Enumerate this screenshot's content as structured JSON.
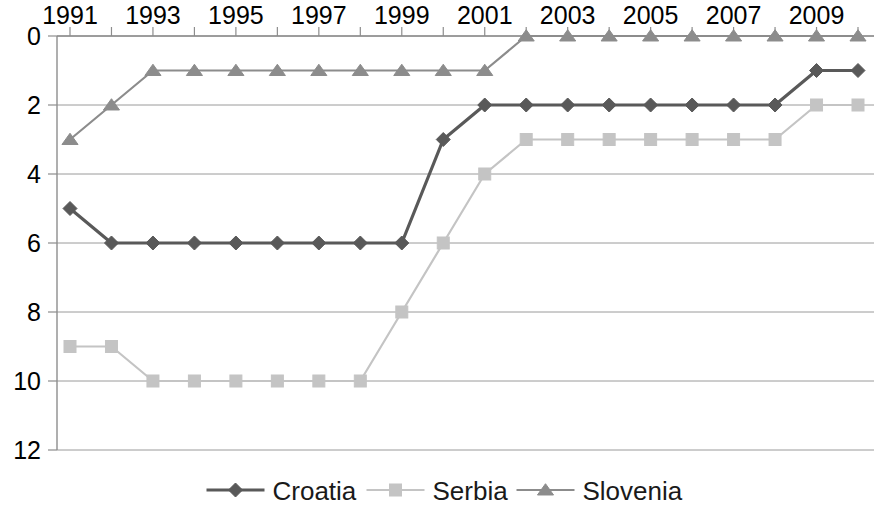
{
  "chart_data": {
    "type": "line",
    "title": "",
    "subtitle": "",
    "xlabel": "",
    "ylabel": "",
    "x": [
      1991,
      1992,
      1993,
      1994,
      1995,
      1996,
      1997,
      1998,
      1999,
      2000,
      2001,
      2002,
      2003,
      2004,
      2005,
      2006,
      2007,
      2008,
      2009,
      2010
    ],
    "x_tick_labels": [
      "1991",
      "1993",
      "1995",
      "1997",
      "1999",
      "2001",
      "2003",
      "2005",
      "2007",
      "2009"
    ],
    "x_tick_values": [
      1991,
      1993,
      1995,
      1997,
      1999,
      2001,
      2003,
      2005,
      2007,
      2009
    ],
    "y_tick_labels": [
      "0",
      "2",
      "4",
      "6",
      "8",
      "10",
      "12"
    ],
    "y_tick_values": [
      0,
      2,
      4,
      6,
      8,
      10,
      12
    ],
    "ylim": [
      0,
      12
    ],
    "y_axis_inverted": true,
    "xlim": [
      1991,
      2010
    ],
    "grid": "horizontal",
    "legend_position": "bottom",
    "series": [
      {
        "name": "Croatia",
        "color": "#595959",
        "marker": "diamond",
        "values": [
          5,
          6,
          6,
          6,
          6,
          6,
          6,
          6,
          6,
          3,
          2,
          2,
          2,
          2,
          2,
          2,
          2,
          2,
          1,
          1
        ]
      },
      {
        "name": "Serbia",
        "color": "#c4c4c4",
        "marker": "square",
        "values": [
          9,
          9,
          10,
          10,
          10,
          10,
          10,
          10,
          8,
          6,
          4,
          3,
          3,
          3,
          3,
          3,
          3,
          3,
          2,
          2
        ]
      },
      {
        "name": "Slovenia",
        "color": "#8c8c8c",
        "marker": "triangle",
        "values": [
          3,
          2,
          1,
          1,
          1,
          1,
          1,
          1,
          1,
          1,
          1,
          0,
          0,
          0,
          0,
          0,
          0,
          0,
          0,
          0
        ]
      }
    ]
  },
  "legend": {
    "items": [
      {
        "label": "Croatia",
        "color": "#595959",
        "marker": "diamond"
      },
      {
        "label": "Serbia",
        "color": "#c4c4c4",
        "marker": "square"
      },
      {
        "label": "Slovenia",
        "color": "#8c8c8c",
        "marker": "triangle"
      }
    ]
  },
  "colors": {
    "croatia": "#595959",
    "serbia": "#c4c4c4",
    "slovenia": "#8c8c8c",
    "grid": "#9a9a9a",
    "axis": "#8d8d8d",
    "text": "#000000",
    "background": "#ffffff"
  }
}
